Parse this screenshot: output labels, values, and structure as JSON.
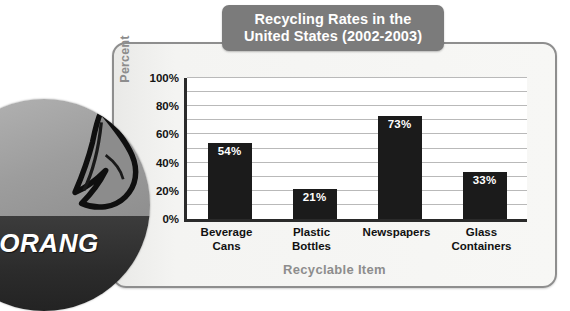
{
  "chart_data": {
    "type": "bar",
    "title": "Recycling Rates in the United States (2002-2003)",
    "title_line1": "Recycling Rates in the",
    "title_line2": "United States (2002-2003)",
    "xlabel": "Recyclable Item",
    "ylabel": "Percent",
    "categories": [
      "Beverage Cans",
      "Plastic Bottles",
      "Newspapers",
      "Glass Containers"
    ],
    "category_lines": [
      [
        "Beverage",
        "Cans"
      ],
      [
        "Plastic",
        "Bottles"
      ],
      [
        "Newspapers",
        ""
      ],
      [
        "Glass",
        "Containers"
      ]
    ],
    "values": [
      54,
      21,
      73,
      33
    ],
    "value_labels": [
      "54%",
      "21%",
      "73%",
      "33%"
    ],
    "ylim": [
      0,
      100
    ],
    "y_ticks": [
      0,
      20,
      40,
      60,
      80,
      100
    ],
    "y_tick_labels": [
      "0%",
      "20%",
      "40%",
      "60%",
      "80%",
      "100%"
    ],
    "y_minor_step": 10,
    "grid": true,
    "legend": "none",
    "bar_color": "#1b1b1b",
    "title_box_color": "#7b7b7b",
    "axis_title_color": "#8d8d8d",
    "gridline_color": "#b9b9b9",
    "panel_color": "#f2f2f0"
  },
  "overlay": {
    "badge_text": "ORANG",
    "badge_icon": "leaf-icon"
  }
}
